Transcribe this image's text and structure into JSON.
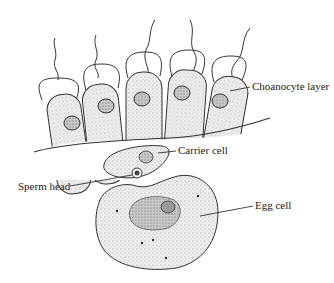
{
  "diagram": {
    "labels": {
      "choanocyte_layer": "Choanocyte layer",
      "carrier_cell": "Carrier cell",
      "sperm_head": "Sperm head",
      "egg_cell": "Egg cell"
    },
    "colors": {
      "ink": "#333333",
      "cell_fill": "#e4e4e4",
      "nucleus_fill": "#bdbdbd"
    }
  }
}
